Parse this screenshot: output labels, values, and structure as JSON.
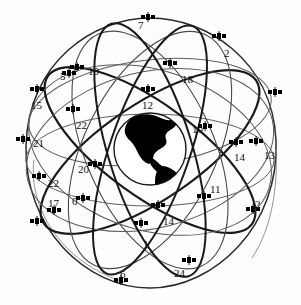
{
  "figure": {
    "earth": {
      "name": "earth-globe",
      "cx": 150,
      "cy": 149,
      "r": 36,
      "landmass": "Americas silhouette",
      "land_color": "#000000",
      "outline_color": "#1a1a1a"
    },
    "style": {
      "background": "#fdfdfd",
      "orbit_color": "#2b2b2b",
      "orbit_thin_color": "#6a6a6a",
      "satellite_color": "#000000",
      "label_color": "#111111"
    },
    "orbit_count": 6,
    "satellite_count": 21,
    "satellites": [
      {
        "id": "sat-7",
        "label": "7",
        "lx": 138,
        "ly": 20,
        "ix": 148,
        "iy": 17
      },
      {
        "id": "sat-2-top",
        "label": "2",
        "lx": 224,
        "ly": 48,
        "ix": 218,
        "iy": 36
      },
      {
        "id": "sat-10-upper-left",
        "label": "10",
        "lx": 88,
        "ly": 66,
        "ix": 76,
        "iy": 67
      },
      {
        "id": "sat-5",
        "label": "5",
        "lx": 60,
        "ly": 71,
        "ix": 68,
        "iy": 73
      },
      {
        "id": "sat-18",
        "label": "18",
        "lx": 182,
        "ly": 74,
        "ix": 170,
        "iy": 62
      },
      {
        "id": "sat-15",
        "label": "15",
        "lx": 31,
        "ly": 100,
        "ix": 36,
        "iy": 88
      },
      {
        "id": "sat-12",
        "label": "12",
        "lx": 142,
        "ly": 100,
        "ix": 147,
        "iy": 88
      },
      {
        "id": "sat-22-upper",
        "label": "22",
        "lx": 76,
        "ly": 120,
        "ix": 72,
        "iy": 108
      },
      {
        "id": "sat-10-right",
        "label": "10",
        "lx": 192,
        "ly": 124,
        "ix": 204,
        "iy": 126
      },
      {
        "id": "sat-21",
        "label": "21",
        "lx": 33,
        "ly": 138,
        "ix": 22,
        "iy": 138
      },
      {
        "id": "sat-14-right",
        "label": "14",
        "lx": 234,
        "ly": 152,
        "ix": 236,
        "iy": 141
      },
      {
        "id": "sat-13",
        "label": "13",
        "lx": 264,
        "ly": 150,
        "ix": 255,
        "iy": 141
      },
      {
        "id": "sat-20",
        "label": "20",
        "lx": 78,
        "ly": 164,
        "ix": 94,
        "iy": 163
      },
      {
        "id": "sat-22-lower",
        "label": "22",
        "lx": 48,
        "ly": 178,
        "ix": 38,
        "iy": 175
      },
      {
        "id": "sat-11",
        "label": "11",
        "lx": 210,
        "ly": 184,
        "ix": 203,
        "iy": 195
      },
      {
        "id": "sat-17",
        "label": "17",
        "lx": 48,
        "ly": 198,
        "ix": 52,
        "iy": 209
      },
      {
        "id": "sat-0",
        "label": "0",
        "lx": 72,
        "ly": 196,
        "ix": 82,
        "iy": 197
      },
      {
        "id": "sat-2-right",
        "label": "2",
        "lx": 255,
        "ly": 199,
        "ix": 252,
        "iy": 208
      },
      {
        "id": "sat-14-bottom",
        "label": "14",
        "lx": 163,
        "ly": 216,
        "ix": 157,
        "iy": 204
      },
      {
        "id": "sat-1",
        "label": "1",
        "lx": 143,
        "ly": 239,
        "ix": 141,
        "iy": 222
      },
      {
        "id": "sat-24",
        "label": "24",
        "lx": 174,
        "ly": 268,
        "ix": 188,
        "iy": 259
      },
      {
        "id": "sat-6",
        "label": "6",
        "lx": 120,
        "ly": 269,
        "ix": 120,
        "iy": 279
      },
      {
        "id": "sat-15-far-right",
        "label": "",
        "lx": 272,
        "ly": 92,
        "ix": 272,
        "iy": 92
      },
      {
        "id": "sat-17-lower-left",
        "label": "",
        "lx": 34,
        "ly": 220,
        "ix": 34,
        "iy": 220
      }
    ]
  }
}
